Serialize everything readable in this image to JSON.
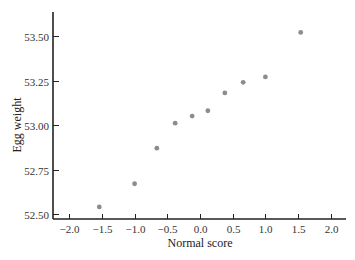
{
  "chart_data": {
    "type": "scatter",
    "title": "",
    "xlabel": "Normal score",
    "ylabel": "Egg weight",
    "xlim": [
      -2.25,
      2.2
    ],
    "ylim": [
      52.45,
      53.63
    ],
    "grid": false,
    "legend": null,
    "x_ticks": [
      -2.0,
      -1.5,
      -1.0,
      -0.5,
      0.0,
      0.5,
      1.0,
      1.5,
      2.0
    ],
    "x_tick_labels": [
      "−2.0",
      "−1.5",
      "−1.0",
      "−0.5",
      "0.0",
      "0.5",
      "1.0",
      "1.5",
      "2.0"
    ],
    "y_ticks": [
      52.5,
      52.75,
      53.0,
      53.25,
      53.5
    ],
    "y_tick_labels": [
      "52.50",
      "52.75",
      "53.00",
      "53.25",
      "53.50"
    ],
    "series": [
      {
        "name": "Egg weight vs normal score",
        "color": "#8c8c8c",
        "x": [
          -1.54,
          -1.0,
          -0.66,
          -0.38,
          -0.12,
          0.12,
          0.38,
          0.66,
          1.0,
          1.54
        ],
        "y": [
          52.54,
          52.67,
          52.87,
          53.01,
          53.05,
          53.08,
          53.18,
          53.24,
          53.27,
          53.52
        ]
      }
    ]
  },
  "colors": {
    "axis": "#222222",
    "point": "#8c8c8c",
    "text": "#333333"
  }
}
